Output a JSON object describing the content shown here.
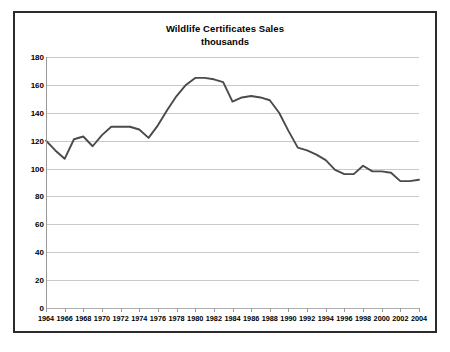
{
  "chart_data": {
    "type": "line",
    "title": "Wildlife Certificates Sales",
    "subtitle": "thousands",
    "xlabel": "",
    "ylabel": "",
    "ylim": [
      0,
      180
    ],
    "ytick_step": 20,
    "yticks": [
      0,
      20,
      40,
      60,
      80,
      100,
      120,
      140,
      160,
      180
    ],
    "grid": true,
    "legend": "none",
    "xlim": [
      1964,
      2004
    ],
    "xtick_step": 2,
    "xticks": [
      1964,
      1966,
      1968,
      1970,
      1972,
      1974,
      1976,
      1978,
      1980,
      1982,
      1984,
      1986,
      1988,
      1990,
      1992,
      1994,
      1996,
      1998,
      2000,
      2002,
      2004
    ],
    "series": [
      {
        "name": "Wildlife Certificates Sales",
        "color": "#4a4a4a",
        "x": [
          1964,
          1965,
          1966,
          1967,
          1968,
          1969,
          1970,
          1971,
          1972,
          1973,
          1974,
          1975,
          1976,
          1977,
          1978,
          1979,
          1980,
          1981,
          1982,
          1983,
          1984,
          1985,
          1986,
          1987,
          1988,
          1989,
          1990,
          1991,
          1992,
          1993,
          1994,
          1995,
          1996,
          1997,
          1998,
          1999,
          2000,
          2001,
          2002,
          2003,
          2004
        ],
        "values": [
          120,
          113,
          107,
          121,
          123,
          116,
          124,
          130,
          130,
          130,
          128,
          122,
          131,
          142,
          152,
          160,
          165,
          165,
          164,
          162,
          148,
          151,
          152,
          151,
          149,
          140,
          127,
          115,
          113,
          110,
          106,
          99,
          96,
          96,
          102,
          98,
          98,
          97,
          91,
          91,
          92
        ]
      }
    ]
  }
}
